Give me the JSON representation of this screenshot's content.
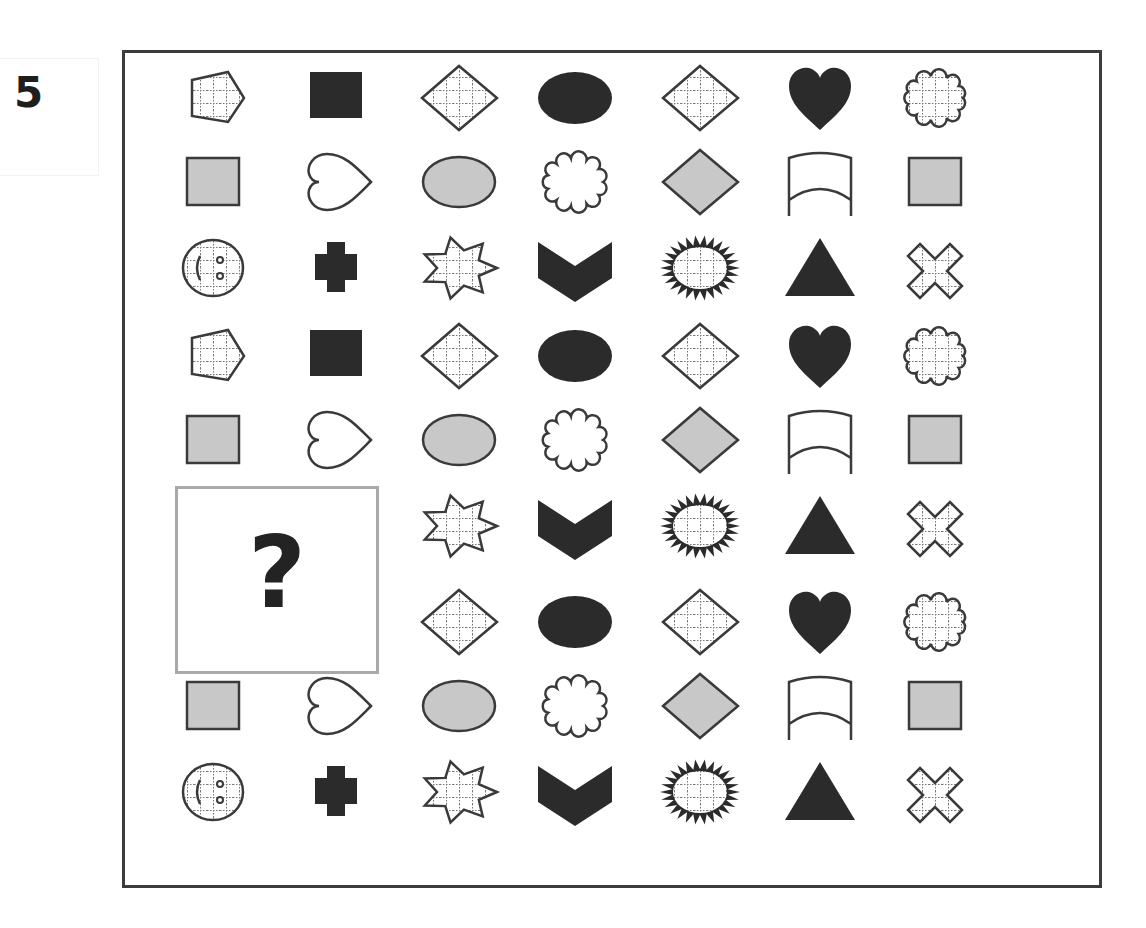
{
  "puzzle": {
    "number": "5",
    "missing_label": "?",
    "colors": {
      "dark": "#2b2b2b",
      "gray": "#c8c8c8",
      "outline": "#3a3a3a",
      "grid": "#777777",
      "frame": "#3c3c3c",
      "missing_border": "#a9a9a9"
    },
    "columns_x": [
      213,
      336,
      459,
      575,
      700,
      820,
      935
    ],
    "rows_y": [
      98,
      182,
      268,
      356,
      440,
      526,
      622,
      706,
      792
    ],
    "grid": [
      [
        "pentagon-grid",
        "square-dark",
        "diamond-grid",
        "oval-dark",
        "diamond-grid",
        "heart-dark",
        "cloud-grid"
      ],
      [
        "square-gray",
        "heart-outline",
        "oval-gray",
        "cloud-outline",
        "diamond-gray",
        "wave-outline",
        "square-gray"
      ],
      [
        "smiley-grid",
        "cross-dark",
        "star7-grid",
        "chevron-dark",
        "sunburst-grid",
        "triangle-dark",
        "x-grid"
      ],
      [
        "pentagon-grid",
        "square-dark",
        "diamond-grid",
        "oval-dark",
        "diamond-grid",
        "heart-dark",
        "cloud-grid"
      ],
      [
        "square-gray",
        "heart-outline",
        "oval-gray",
        "cloud-outline",
        "diamond-gray",
        "wave-outline",
        "square-gray"
      ],
      [
        "missing",
        "missing",
        "star7-grid",
        "chevron-dark",
        "sunburst-grid",
        "triangle-dark",
        "x-grid"
      ],
      [
        "missing",
        "missing",
        "diamond-grid",
        "oval-dark",
        "diamond-grid",
        "heart-dark",
        "cloud-grid"
      ],
      [
        "square-gray",
        "heart-outline",
        "oval-gray",
        "cloud-outline",
        "diamond-gray",
        "wave-outline",
        "square-gray"
      ],
      [
        "smiley-grid",
        "cross-dark",
        "star7-grid",
        "chevron-dark",
        "sunburst-grid",
        "triangle-dark",
        "x-grid"
      ]
    ]
  }
}
